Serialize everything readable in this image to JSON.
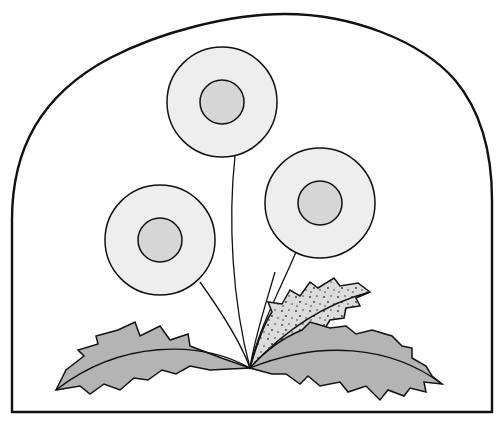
{
  "illustration": {
    "subject": "Dandelion plant line drawing",
    "frame": {
      "shape": "arched-rectangle",
      "stroke": "#111111",
      "fill": "#ffffff"
    },
    "flowers": [
      {
        "name": "top-flower",
        "cx": 222,
        "cy": 102,
        "outer_r": 55,
        "inner_r": 22
      },
      {
        "name": "left-flower",
        "cx": 160,
        "cy": 240,
        "outer_r": 55,
        "inner_r": 22
      },
      {
        "name": "right-flower",
        "cx": 320,
        "cy": 203,
        "outer_r": 55,
        "inner_r": 22
      }
    ],
    "colors": {
      "outline": "#111111",
      "petal_fill": "#eeeeee",
      "center_fill": "#d6d6d6",
      "leaf_fill": "#b4b4b4",
      "speckled_leaf_fill": "#dcdcdc",
      "speckle": "#333333"
    }
  }
}
